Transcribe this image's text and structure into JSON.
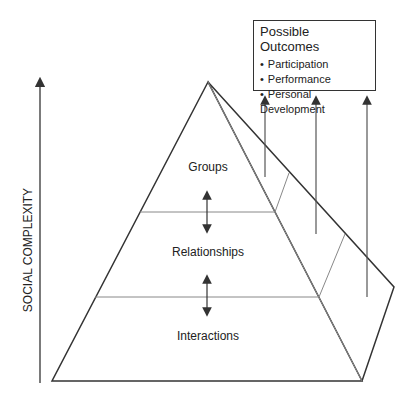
{
  "axis": {
    "label": "SOCIAL COMPLEXITY"
  },
  "pyramid": {
    "levels": [
      {
        "label": "Groups"
      },
      {
        "label": "Relationships"
      },
      {
        "label": "Interactions"
      }
    ]
  },
  "outcomes": {
    "title": "Possible Outcomes",
    "items": [
      "Participation",
      "Performance",
      "Personal Development"
    ]
  },
  "colors": {
    "line": "#333333",
    "thin_line": "#888888",
    "text": "#222222"
  }
}
